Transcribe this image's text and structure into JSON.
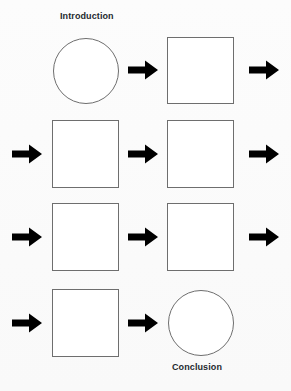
{
  "diagram": {
    "background_color": "#fbfbfb",
    "shape_fill": "#ffffff",
    "shape_stroke": "#6e6e6e",
    "arrow_color": "#000000",
    "label_color": "#24292e",
    "labels": {
      "start": "Introduction",
      "end": "Conclusion"
    },
    "nodes": [
      {
        "id": "n1",
        "shape": "circle",
        "row": 1,
        "col": 1,
        "label": "Introduction",
        "text": ""
      },
      {
        "id": "n2",
        "shape": "square",
        "row": 1,
        "col": 2,
        "label": "",
        "text": ""
      },
      {
        "id": "n3",
        "shape": "square",
        "row": 2,
        "col": 1,
        "label": "",
        "text": ""
      },
      {
        "id": "n4",
        "shape": "square",
        "row": 2,
        "col": 2,
        "label": "",
        "text": ""
      },
      {
        "id": "n5",
        "shape": "square",
        "row": 3,
        "col": 1,
        "label": "",
        "text": ""
      },
      {
        "id": "n6",
        "shape": "square",
        "row": 3,
        "col": 2,
        "label": "",
        "text": ""
      },
      {
        "id": "n7",
        "shape": "square",
        "row": 4,
        "col": 1,
        "label": "",
        "text": ""
      },
      {
        "id": "n8",
        "shape": "circle",
        "row": 4,
        "col": 2,
        "label": "Conclusion",
        "text": ""
      }
    ],
    "connectors": [
      {
        "id": "a1",
        "from": "n1",
        "to": "n2",
        "direction": "right",
        "kind": "inline"
      },
      {
        "id": "a2",
        "from": "n2",
        "to": "n3",
        "direction": "right",
        "kind": "wrap-out"
      },
      {
        "id": "a3",
        "from": "n2",
        "to": "n3",
        "direction": "right",
        "kind": "wrap-in"
      },
      {
        "id": "a4",
        "from": "n3",
        "to": "n4",
        "direction": "right",
        "kind": "inline"
      },
      {
        "id": "a5",
        "from": "n4",
        "to": "n5",
        "direction": "right",
        "kind": "wrap-out"
      },
      {
        "id": "a6",
        "from": "n4",
        "to": "n5",
        "direction": "right",
        "kind": "wrap-in"
      },
      {
        "id": "a7",
        "from": "n5",
        "to": "n6",
        "direction": "right",
        "kind": "inline"
      },
      {
        "id": "a8",
        "from": "n6",
        "to": "n7",
        "direction": "right",
        "kind": "wrap-out"
      },
      {
        "id": "a9",
        "from": "n6",
        "to": "n7",
        "direction": "right",
        "kind": "wrap-in"
      },
      {
        "id": "a10",
        "from": "n7",
        "to": "n8",
        "direction": "right",
        "kind": "inline"
      }
    ]
  }
}
